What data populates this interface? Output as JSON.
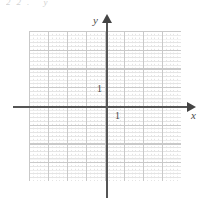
{
  "figure": {
    "name": "cartesian-coordinate-grid",
    "top_artifact_text": "22.   y"
  },
  "axes": {
    "x": {
      "label": "x",
      "arrow": "right-arrow-icon",
      "tick_label": "1"
    },
    "y": {
      "label": "y",
      "arrow": "up-arrow-icon",
      "tick_label": "1"
    }
  },
  "colors": {
    "axis": "#555555",
    "arrow": "#444444",
    "major_grid": "#c9c9c9",
    "minor_grid": "#e4e4e4",
    "text": "#4a4a4a",
    "background": "#ffffff"
  },
  "chart_data": {
    "type": "scatter",
    "title": "",
    "subtitle": "",
    "xlabel": "x",
    "ylabel": "y",
    "xlim": [
      -4,
      4
    ],
    "ylim": [
      -4,
      4
    ],
    "xticks": [
      -4,
      -3,
      -2,
      -1,
      0,
      1,
      2,
      3,
      4
    ],
    "yticks": [
      -4,
      -3,
      -2,
      -1,
      0,
      1,
      2,
      3,
      4
    ],
    "xtick_labels": [
      "",
      "",
      "",
      "",
      "",
      "1",
      "",
      "",
      ""
    ],
    "ytick_labels": [
      "",
      "",
      "",
      "",
      "",
      "1",
      "",
      "",
      ""
    ],
    "grid": true,
    "grid_major_spacing": 1,
    "grid_minor_subdivisions": 5,
    "legend": null,
    "series": [],
    "x": [],
    "y": [],
    "annotations": [
      {
        "text": "1",
        "x": 0,
        "y": 1,
        "placement": "left-of-y-axis"
      },
      {
        "text": "1",
        "x": 1,
        "y": 0,
        "placement": "below-x-axis"
      }
    ]
  }
}
